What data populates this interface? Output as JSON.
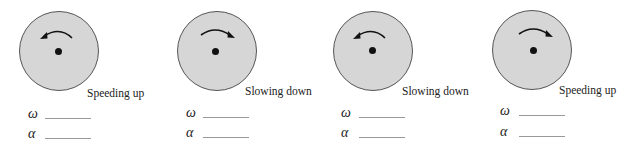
{
  "figure": {
    "panels": [
      {
        "caption": "Speeding up",
        "rotation": "counterclockwise",
        "omega_label": "ω",
        "alpha_label": "α",
        "omega_value": "",
        "alpha_value": ""
      },
      {
        "caption": "Slowing down",
        "rotation": "clockwise",
        "omega_label": "ω",
        "alpha_label": "α",
        "omega_value": "",
        "alpha_value": ""
      },
      {
        "caption": "Slowing down",
        "rotation": "counterclockwise",
        "omega_label": "ω",
        "alpha_label": "α",
        "omega_value": "",
        "alpha_value": ""
      },
      {
        "caption": "Speeding up",
        "rotation": "clockwise",
        "omega_label": "ω",
        "alpha_label": "α",
        "omega_value": "",
        "alpha_value": ""
      }
    ],
    "colors": {
      "disk_fill": "#d6d6d6",
      "disk_border": "#555555",
      "ink": "#222222",
      "blank_line": "#999999"
    }
  }
}
